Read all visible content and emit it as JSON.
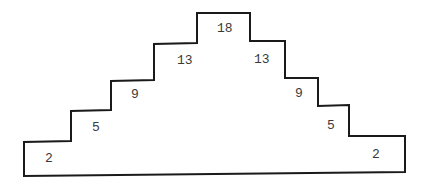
{
  "diagram": {
    "type": "stepped-pyramid",
    "stroke_color": "#1a1a1a",
    "steps": [
      {
        "side": "left",
        "level": 1,
        "label": "2"
      },
      {
        "side": "left",
        "level": 2,
        "label": "5"
      },
      {
        "side": "left",
        "level": 3,
        "label": "9"
      },
      {
        "side": "left",
        "level": 4,
        "label": "13"
      },
      {
        "side": "center",
        "level": 5,
        "label": "18"
      },
      {
        "side": "right",
        "level": 4,
        "label": "13"
      },
      {
        "side": "right",
        "level": 3,
        "label": "9"
      },
      {
        "side": "right",
        "level": 2,
        "label": "5"
      },
      {
        "side": "right",
        "level": 1,
        "label": "2"
      }
    ]
  }
}
